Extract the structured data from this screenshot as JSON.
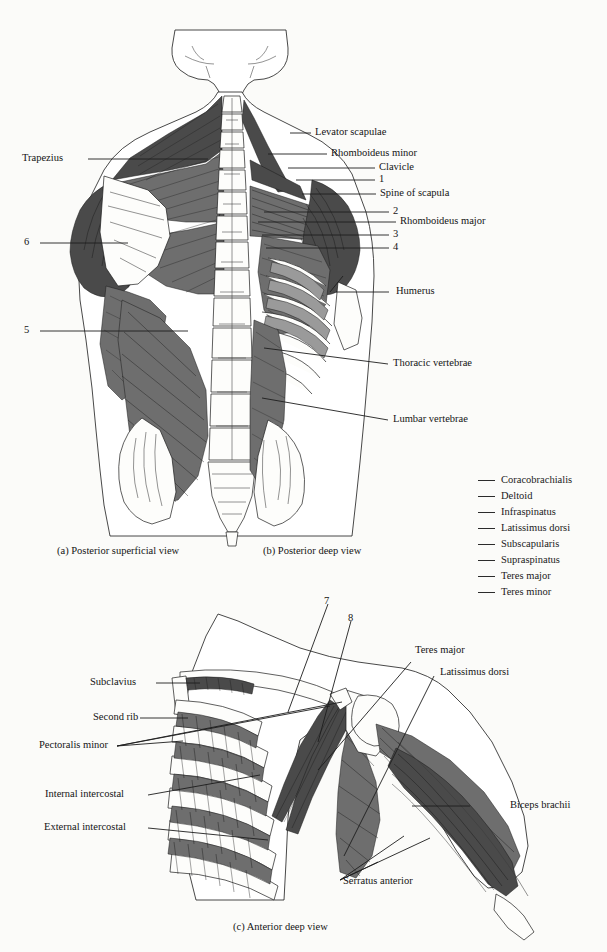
{
  "figure": {
    "background_color": "#fbfbf9",
    "ink_color": "#1a1a1a"
  },
  "panels": [
    {
      "id": "a",
      "caption": "(a) Posterior superficial view"
    },
    {
      "id": "b",
      "caption": "(b) Posterior deep view"
    },
    {
      "id": "c",
      "caption": "(c) Anterior deep view"
    }
  ],
  "panel_a_labels": [
    {
      "text": "Trapezius"
    },
    {
      "text": "6"
    },
    {
      "text": "5"
    }
  ],
  "panel_b_labels": [
    {
      "text": "Levator scapulae"
    },
    {
      "text": "Rhomboideus minor"
    },
    {
      "text": "Clavicle"
    },
    {
      "text": "1"
    },
    {
      "text": "Spine of scapula"
    },
    {
      "text": "2"
    },
    {
      "text": "Rhomboideus major"
    },
    {
      "text": "3"
    },
    {
      "text": "4"
    },
    {
      "text": "Humerus"
    },
    {
      "text": "Thoracic vertebrae"
    },
    {
      "text": "Lumbar vertebrae"
    }
  ],
  "panel_c_labels": [
    {
      "text": "Subclavius"
    },
    {
      "text": "Second rib"
    },
    {
      "text": "Pectoralis minor"
    },
    {
      "text": "Internal intercostal"
    },
    {
      "text": "External intercostal"
    },
    {
      "text": "7"
    },
    {
      "text": "8"
    },
    {
      "text": "Teres major"
    },
    {
      "text": "Latissimus dorsi"
    },
    {
      "text": "Biceps brachii"
    },
    {
      "text": "Serratus anterior"
    }
  ],
  "legend": {
    "items": [
      {
        "label": "Coracobrachialis"
      },
      {
        "label": "Deltoid"
      },
      {
        "label": "Infraspinatus"
      },
      {
        "label": "Latissimus dorsi"
      },
      {
        "label": "Subscapularis"
      },
      {
        "label": "Supraspinatus"
      },
      {
        "label": "Teres major"
      },
      {
        "label": "Teres minor"
      }
    ]
  }
}
